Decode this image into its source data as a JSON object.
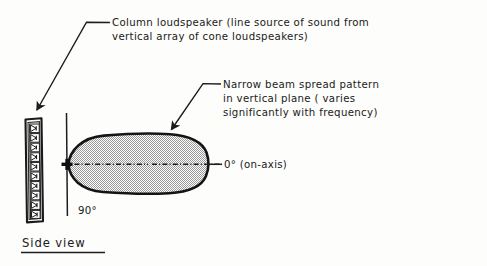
{
  "figure": {
    "caption": "Side view",
    "annotations": [
      {
        "id": "column-loudspeaker",
        "lines": [
          "Column loudspeaker  (line source of sound from",
          "vertical array of cone loudspeakers)"
        ]
      },
      {
        "id": "beam-pattern",
        "lines": [
          "Narrow beam spread pattern",
          "in vertical plane ( varies",
          "significantly with frequency)"
        ]
      }
    ],
    "axis_labels": {
      "on_axis": "0° (on-axis)",
      "perpendicular": "90°"
    },
    "elements": {
      "speaker_column_name": "column-loudspeaker-enclosure",
      "cone_driver_count": 10,
      "beam_lobe_name": "narrow-beam-lobe",
      "origin_marker_name": "origin-cross-marker"
    },
    "colors": {
      "ink": "#1a1a1a",
      "lobe_outline": "#141414",
      "lobe_fill": "#d9d9d9",
      "paper": "#fdfdfb"
    }
  }
}
